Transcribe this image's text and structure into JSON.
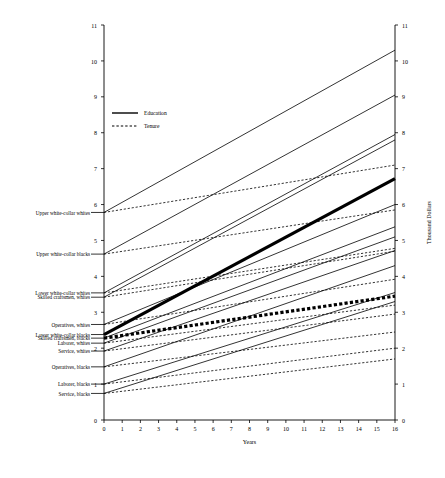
{
  "chart_data": {
    "type": "line",
    "title": "",
    "xlabel": "Years",
    "ylabel_right": "Thousand Dollars",
    "ylabel_left": "",
    "xlim": [
      0,
      16
    ],
    "ylim": [
      0,
      11
    ],
    "xticks": [
      0,
      1,
      2,
      3,
      4,
      5,
      6,
      7,
      8,
      9,
      10,
      11,
      12,
      13,
      14,
      15,
      16
    ],
    "yticks": [
      0,
      1,
      2,
      3,
      4,
      5,
      6,
      7,
      8,
      9,
      10,
      11
    ],
    "grid": false,
    "legend_position": "upper-left-inside",
    "legend": [
      {
        "name": "Education",
        "style": "solid"
      },
      {
        "name": "Tenure",
        "style": "dotted"
      }
    ],
    "group_labels": [
      {
        "label": "Upper white-collar whites",
        "y": 5.78
      },
      {
        "label": "Upper white-collar blacks",
        "y": 4.62
      },
      {
        "label": "Lower white-collar whites",
        "y": 3.54
      },
      {
        "label": "Skilled craftsmen, whites",
        "y": 3.42
      },
      {
        "label": "Operatives, whites",
        "y": 2.66
      },
      {
        "label": "Lower white-collar blacks",
        "y": 2.38
      },
      {
        "label": "Skilled craftsmen, blacks",
        "y": 2.28
      },
      {
        "label": "Laborer, whites",
        "y": 2.14
      },
      {
        "label": "Service, whites",
        "y": 1.92
      },
      {
        "label": "Operatives, blacks",
        "y": 1.48
      },
      {
        "label": "Laborer, blacks",
        "y": 1.0
      },
      {
        "label": "Service, blacks",
        "y": 0.74
      }
    ],
    "series": [
      {
        "name": "Upper white-collar whites - Education",
        "style": "solid",
        "weight": "normal",
        "x": [
          0,
          16
        ],
        "values": [
          5.78,
          10.3
        ]
      },
      {
        "name": "Upper white-collar whites - Tenure",
        "style": "dotted",
        "weight": "normal",
        "x": [
          0,
          16
        ],
        "values": [
          5.78,
          7.1
        ]
      },
      {
        "name": "Upper white-collar blacks - Education",
        "style": "solid",
        "weight": "normal",
        "x": [
          0,
          16
        ],
        "values": [
          4.62,
          9.05
        ]
      },
      {
        "name": "Upper white-collar blacks - Tenure",
        "style": "dotted",
        "weight": "normal",
        "x": [
          0,
          16
        ],
        "values": [
          4.62,
          5.85
        ]
      },
      {
        "name": "Lower white-collar whites - Education",
        "style": "solid",
        "weight": "normal",
        "x": [
          0,
          16
        ],
        "values": [
          3.54,
          7.95
        ]
      },
      {
        "name": "Lower white-collar whites - Tenure",
        "style": "dotted",
        "weight": "normal",
        "x": [
          0,
          16
        ],
        "values": [
          3.54,
          4.78
        ]
      },
      {
        "name": "Skilled craftsmen, whites - Education",
        "style": "solid",
        "weight": "normal",
        "x": [
          0,
          16
        ],
        "values": [
          3.42,
          7.8
        ]
      },
      {
        "name": "Skilled craftsmen, whites - Tenure",
        "style": "dotted",
        "weight": "normal",
        "x": [
          0,
          16
        ],
        "values": [
          3.42,
          4.7
        ]
      },
      {
        "name": "Operatives, whites - Education",
        "style": "solid",
        "weight": "normal",
        "x": [
          0,
          16
        ],
        "values": [
          2.66,
          6.0
        ]
      },
      {
        "name": "Operatives, whites - Tenure",
        "style": "dotted",
        "weight": "normal",
        "x": [
          0,
          16
        ],
        "values": [
          2.66,
          3.92
        ]
      },
      {
        "name": "Lower white-collar blacks - Education",
        "style": "solid",
        "weight": "bold",
        "x": [
          0,
          16
        ],
        "values": [
          2.38,
          6.72
        ]
      },
      {
        "name": "Lower white-collar blacks - Tenure",
        "style": "dotted",
        "weight": "bold",
        "x": [
          0,
          16
        ],
        "values": [
          2.28,
          3.45
        ]
      },
      {
        "name": "Skilled craftsmen, blacks - Education",
        "style": "solid",
        "weight": "normal",
        "x": [
          0,
          16
        ],
        "values": [
          2.28,
          5.38
        ]
      },
      {
        "name": "Laborer, whites - Education",
        "style": "solid",
        "weight": "normal",
        "x": [
          0,
          16
        ],
        "values": [
          2.14,
          5.1
        ]
      },
      {
        "name": "Laborer, whites - Tenure",
        "style": "dotted",
        "weight": "normal",
        "x": [
          0,
          16
        ],
        "values": [
          2.14,
          3.2
        ]
      },
      {
        "name": "Service, whites - Education",
        "style": "solid",
        "weight": "normal",
        "x": [
          0,
          16
        ],
        "values": [
          1.92,
          4.72
        ]
      },
      {
        "name": "Service, whites - Tenure",
        "style": "dotted",
        "weight": "normal",
        "x": [
          0,
          16
        ],
        "values": [
          1.92,
          2.95
        ]
      },
      {
        "name": "Operatives, blacks - Education",
        "style": "solid",
        "weight": "normal",
        "x": [
          0,
          16
        ],
        "values": [
          1.48,
          4.3
        ]
      },
      {
        "name": "Operatives, blacks - Tenure",
        "style": "dotted",
        "weight": "normal",
        "x": [
          0,
          16
        ],
        "values": [
          1.48,
          2.45
        ]
      },
      {
        "name": "Laborer, blacks - Education",
        "style": "solid",
        "weight": "normal",
        "x": [
          0,
          16
        ],
        "values": [
          1.0,
          3.55
        ]
      },
      {
        "name": "Laborer, blacks - Tenure",
        "style": "dotted",
        "weight": "normal",
        "x": [
          0,
          16
        ],
        "values": [
          1.0,
          2.0
        ]
      },
      {
        "name": "Service, blacks - Education",
        "style": "solid",
        "weight": "normal",
        "x": [
          0,
          16
        ],
        "values": [
          0.74,
          3.3
        ]
      },
      {
        "name": "Service, blacks - Tenure",
        "style": "dotted",
        "weight": "normal",
        "x": [
          0,
          16
        ],
        "values": [
          0.74,
          1.7
        ]
      }
    ]
  },
  "axis_color": "#000000",
  "line_color": "#000000"
}
